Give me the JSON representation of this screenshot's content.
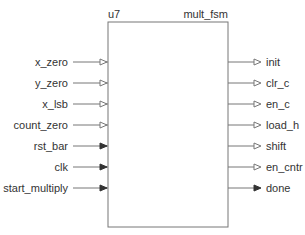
{
  "block": {
    "instance": "u7",
    "module": "mult_fsm",
    "box": {
      "x": 108,
      "y": 22,
      "width": 120,
      "height": 205
    },
    "colors": {
      "line": "#777777",
      "text": "#333333",
      "fill": "#ffffff"
    }
  },
  "inputs": [
    {
      "name": "x_zero",
      "arrow": "open"
    },
    {
      "name": "y_zero",
      "arrow": "open"
    },
    {
      "name": "x_lsb",
      "arrow": "open"
    },
    {
      "name": "count_zero",
      "arrow": "open"
    },
    {
      "name": "rst_bar",
      "arrow": "filled"
    },
    {
      "name": "clk",
      "arrow": "filled"
    },
    {
      "name": "start_multiply",
      "arrow": "filled"
    }
  ],
  "outputs": [
    {
      "name": "init",
      "arrow": "open"
    },
    {
      "name": "clr_c",
      "arrow": "open"
    },
    {
      "name": "en_c",
      "arrow": "open"
    },
    {
      "name": "load_h",
      "arrow": "open"
    },
    {
      "name": "shift",
      "arrow": "open"
    },
    {
      "name": "en_cntr",
      "arrow": "open"
    },
    {
      "name": "done",
      "arrow": "filled"
    }
  ],
  "layout": {
    "first_row_y": 62,
    "row_pitch": 21
  }
}
